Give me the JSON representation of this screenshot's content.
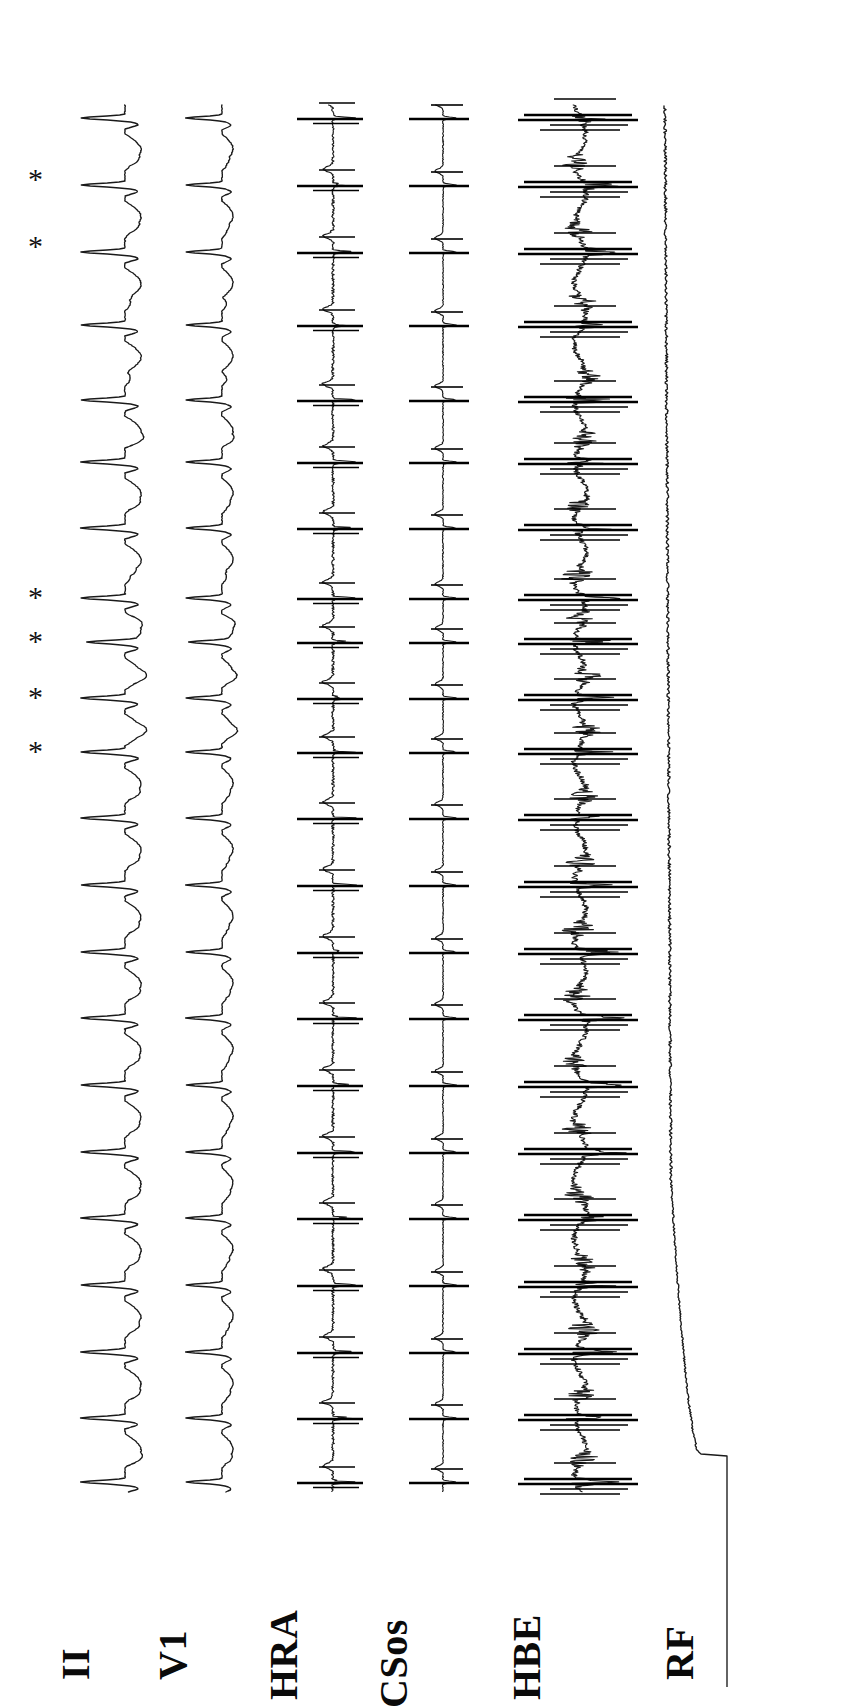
{
  "figure": {
    "kind": "intracardiac-electrophysiology-recording",
    "orientation": "rotated-90-ccw",
    "background_color": "#ffffff",
    "trace_color": "#1a1a1a",
    "width": 846,
    "height": 1687
  },
  "channels": [
    {
      "id": "ii",
      "label": "II",
      "baseline_x": 125,
      "type": "surface-ecg",
      "label_x": 96,
      "label_y": 1640
    },
    {
      "id": "v1",
      "label": "V1",
      "baseline_x": 222,
      "type": "surface-ecg",
      "label_x": 193,
      "label_y": 1640
    },
    {
      "id": "hra",
      "label": "HRA",
      "baseline_x": 333,
      "type": "intracardiac",
      "label_x": 304,
      "label_y": 1660
    },
    {
      "id": "csos",
      "label": "CSos",
      "baseline_x": 443,
      "type": "intracardiac",
      "label_x": 414,
      "label_y": 1668
    },
    {
      "id": "hbe",
      "label": "HBE",
      "baseline_x": 580,
      "type": "intracardiac",
      "label_x": 547,
      "label_y": 1660
    },
    {
      "id": "rf",
      "label": "RF",
      "baseline_x": 727,
      "type": "ablation-energy",
      "label_x": 700,
      "label_y": 1640
    }
  ],
  "annotations": {
    "marker_glyph": "*",
    "marker_name": "asterisk",
    "marker_x": 28,
    "marker_beats_y": [
      180,
      247,
      598,
      642,
      698,
      752
    ]
  },
  "chart_data": {
    "type": "line",
    "title": "",
    "xlabel": "",
    "ylabel": "",
    "time_axis": "vertical (top = start, bottom = end)",
    "amplitude_axis": "horizontal",
    "trace_start_y": 105,
    "trace_end_y": 1492,
    "beat_count": 21,
    "beat_times_y": [
      118,
      185,
      252,
      325,
      400,
      462,
      528,
      598,
      642,
      698,
      752,
      818,
      885,
      952,
      1018,
      1085,
      1152,
      1218,
      1285,
      1352,
      1418,
      1482
    ],
    "series": [
      {
        "name": "II",
        "baseline_x": 125,
        "description": "surface ECG lead II, tall leftward QRS deflections with T waves",
        "qrs_amplitude_px": 42,
        "t_amplitude_px": 14
      },
      {
        "name": "V1",
        "baseline_x": 222,
        "description": "surface ECG lead V1, narrower biphasic QRS",
        "qrs_amplitude_px": 34,
        "t_amplitude_px": 10
      },
      {
        "name": "HRA",
        "baseline_x": 333,
        "description": "high right atrium bipolar electrogram, sharp atrial spikes",
        "spike_amplitude_px": 28
      },
      {
        "name": "CSos",
        "baseline_x": 443,
        "description": "coronary sinus ostium electrogram, low amplitude flat baseline with atrial spikes",
        "spike_amplitude_px": 22
      },
      {
        "name": "HBE",
        "baseline_x": 580,
        "description": "His bundle electrogram, very noisy with large saturated artifacts during RF delivery",
        "noise_amplitude_px": 40,
        "spike_amplitude_px": 70
      },
      {
        "name": "RF",
        "baseline_x": 727,
        "description": "radiofrequency energy channel, step onset near y=1460 then gradual ramp and plateau",
        "step_y": 1456,
        "ramp_end_y": 1180,
        "plateau_x": 727,
        "step_from_x": 727,
        "step_to_x": 700
      }
    ]
  }
}
